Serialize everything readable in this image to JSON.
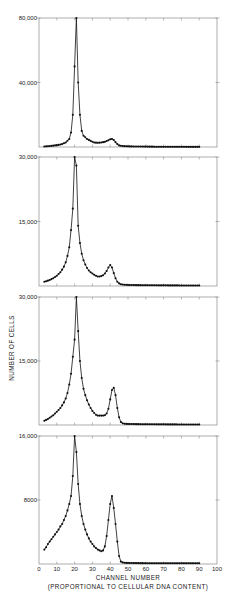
{
  "chart_data": [
    {
      "type": "line",
      "panel": 1,
      "xlabel": "CHANNEL NUMBER",
      "ylabel": "NUMBER OF CELLS",
      "xlim": [
        0,
        100
      ],
      "ylim": [
        0,
        80000
      ],
      "yticks": [
        40000,
        80000
      ],
      "ytick_labels": [
        "40,000",
        "80,000"
      ],
      "peaks": [
        {
          "channel": 21,
          "cells": 80000
        },
        {
          "channel": 41,
          "cells": 5000
        }
      ],
      "x": [
        3,
        5,
        7,
        9,
        11,
        13,
        15,
        17,
        18,
        19,
        20,
        21,
        22,
        23,
        24,
        25,
        27,
        29,
        31,
        33,
        35,
        37,
        39,
        40,
        41,
        42,
        43,
        44,
        45,
        47,
        50,
        55,
        60,
        65,
        70,
        75,
        80,
        85,
        90
      ],
      "values": [
        300,
        500,
        700,
        1000,
        1300,
        1800,
        2800,
        5000,
        9000,
        20000,
        50000,
        80000,
        40000,
        20000,
        10000,
        7000,
        5000,
        3800,
        2800,
        2600,
        2800,
        3200,
        4200,
        4800,
        5000,
        4300,
        3000,
        1800,
        1000,
        600,
        400,
        300,
        250,
        200,
        180,
        150,
        120,
        100,
        100
      ]
    },
    {
      "type": "line",
      "panel": 2,
      "xlim": [
        0,
        100
      ],
      "ylim": [
        0,
        30000
      ],
      "yticks": [
        15000,
        30000
      ],
      "ytick_labels": [
        "15,000",
        "30,000"
      ],
      "peaks": [
        {
          "channel": 20,
          "cells": 30000
        },
        {
          "channel": 40,
          "cells": 4900
        }
      ],
      "x": [
        3,
        4,
        5,
        6,
        7,
        8,
        9,
        10,
        11,
        12,
        13,
        14,
        15,
        16,
        17,
        18,
        19,
        20,
        21,
        22,
        23,
        24,
        25,
        26,
        27,
        28,
        29,
        30,
        31,
        32,
        33,
        34,
        35,
        36,
        37,
        38,
        39,
        40,
        41,
        42,
        43,
        44,
        45,
        46,
        48,
        50,
        55,
        60,
        65,
        70,
        75,
        80,
        85,
        90
      ],
      "values": [
        1000,
        1100,
        1250,
        1400,
        1600,
        1800,
        2100,
        2400,
        2800,
        3200,
        3800,
        4500,
        5500,
        7000,
        9000,
        13000,
        18000,
        30000,
        28000,
        14000,
        10000,
        7500,
        6000,
        5000,
        4200,
        3600,
        3200,
        2900,
        2600,
        2400,
        2200,
        2200,
        2300,
        2500,
        2900,
        3500,
        4300,
        4900,
        4300,
        3000,
        1800,
        1000,
        600,
        400,
        300,
        250,
        200,
        180,
        160,
        150,
        140,
        130,
        120,
        110
      ]
    },
    {
      "type": "line",
      "panel": 3,
      "xlim": [
        0,
        100
      ],
      "ylim": [
        0,
        30000
      ],
      "yticks": [
        15000,
        30000
      ],
      "ytick_labels": [
        "15,000",
        "30,000"
      ],
      "peaks": [
        {
          "channel": 21,
          "cells": 30000
        },
        {
          "channel": 42,
          "cells": 8700
        }
      ],
      "x": [
        3,
        4,
        5,
        6,
        7,
        8,
        9,
        10,
        11,
        12,
        13,
        14,
        15,
        16,
        17,
        18,
        19,
        20,
        21,
        22,
        23,
        24,
        25,
        26,
        27,
        28,
        29,
        30,
        31,
        32,
        33,
        34,
        35,
        36,
        37,
        38,
        39,
        40,
        41,
        42,
        43,
        44,
        45,
        46,
        47,
        48,
        50,
        55,
        60,
        65,
        70,
        75,
        80,
        85,
        90
      ],
      "values": [
        1000,
        1200,
        1400,
        1700,
        2000,
        2300,
        2700,
        3100,
        3500,
        4000,
        4600,
        5300,
        6200,
        7500,
        9500,
        12000,
        16000,
        20000,
        30000,
        22000,
        15000,
        11000,
        8500,
        7000,
        5800,
        4800,
        4000,
        3300,
        2800,
        2400,
        2200,
        2200,
        2200,
        2200,
        2300,
        2700,
        3800,
        6000,
        8200,
        8700,
        7000,
        4000,
        1800,
        700,
        400,
        300,
        250,
        200,
        180,
        160,
        150,
        140,
        130,
        120,
        110
      ]
    },
    {
      "type": "line",
      "panel": 4,
      "xlim": [
        0,
        100
      ],
      "ylim": [
        0,
        16000
      ],
      "yticks": [
        8000,
        16000
      ],
      "ytick_labels": [
        "8000",
        "16,000"
      ],
      "xticks": [
        0,
        10,
        20,
        30,
        40,
        50,
        60,
        70,
        80,
        90,
        100
      ],
      "peaks": [
        {
          "channel": 20,
          "cells": 16000
        },
        {
          "channel": 41,
          "cells": 8500
        }
      ],
      "x": [
        3,
        4,
        5,
        6,
        7,
        8,
        9,
        10,
        11,
        12,
        13,
        14,
        15,
        16,
        17,
        18,
        19,
        20,
        21,
        22,
        23,
        24,
        25,
        26,
        27,
        28,
        29,
        30,
        31,
        32,
        33,
        34,
        35,
        36,
        37,
        38,
        39,
        40,
        41,
        42,
        43,
        44,
        45,
        46,
        47,
        48,
        50,
        55,
        60,
        65,
        70,
        75,
        80,
        85,
        90
      ],
      "values": [
        1800,
        2100,
        2500,
        2800,
        3100,
        3400,
        3700,
        4000,
        4300,
        4700,
        5000,
        5500,
        6000,
        6700,
        7500,
        8500,
        11000,
        16000,
        14000,
        10000,
        7500,
        6000,
        5000,
        4300,
        3700,
        3200,
        2800,
        2500,
        2200,
        2000,
        1800,
        1700,
        1600,
        1700,
        2200,
        3500,
        5500,
        7500,
        8500,
        7000,
        5000,
        2800,
        1000,
        300,
        200,
        150,
        120,
        110,
        100,
        100,
        100,
        100,
        100,
        100,
        100
      ]
    }
  ],
  "labels": {
    "panel1_ytick_top": "80,000",
    "panel1_ytick_mid": "40,000",
    "panel2_ytick_top": "30,000",
    "panel2_ytick_mid": "15,000",
    "panel3_ytick_top": "30,000",
    "panel3_ytick_mid": "15,000",
    "panel4_ytick_top": "16,000",
    "panel4_ytick_mid": "8000",
    "ylabel": "NUMBER OF CELLS",
    "xlabel": "CHANNEL NUMBER",
    "xlabel_sub": "(PROPORTIONAL TO CELLULAR DNA CONTENT)",
    "xticks": [
      "0",
      "10",
      "20",
      "30",
      "40",
      "50",
      "60",
      "70",
      "80",
      "90",
      "100"
    ]
  }
}
